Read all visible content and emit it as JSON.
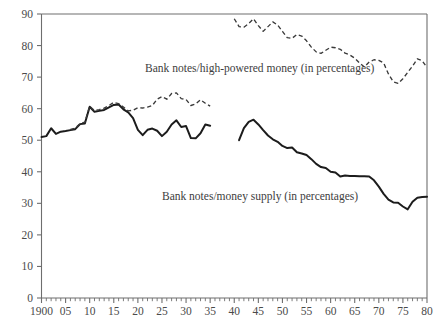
{
  "chart_data": {
    "type": "line",
    "title": "",
    "subtitle": "",
    "xlabel": "",
    "ylabel": "",
    "xlim": [
      1900,
      1980
    ],
    "ylim": [
      0,
      90
    ],
    "grid": false,
    "legend_position": "inline-annotations",
    "y_ticks": [
      0,
      10,
      20,
      30,
      40,
      50,
      60,
      70,
      80,
      90
    ],
    "y_tick_labels": [
      "0",
      "10",
      "20",
      "30",
      "40",
      "50",
      "60",
      "70",
      "80",
      "90"
    ],
    "x_ticks": [
      1900,
      1905,
      1910,
      1915,
      1920,
      1925,
      1930,
      1935,
      1940,
      1945,
      1950,
      1955,
      1960,
      1965,
      1970,
      1975,
      1980
    ],
    "x_tick_labels": [
      "1900",
      "05",
      "10",
      "15",
      "20",
      "25",
      "30",
      "35",
      "40",
      "45",
      "50",
      "55",
      "60",
      "65",
      "70",
      "75",
      "80"
    ],
    "x_minor_tick_step": 1,
    "annotations": [
      {
        "name": "annotation-high-powered-money",
        "text": "Bank notes/high-powered money (in percentages)",
        "x": 1921.5,
        "y": 71.5
      },
      {
        "name": "annotation-money-supply",
        "text": "Bank notes/money supply (in percentages)",
        "x": 1925.0,
        "y": 31.0
      }
    ],
    "series": [
      {
        "name": "Bank notes/money supply (in percentages)",
        "style": "solid",
        "color": "#1c1c1c",
        "segments": [
          {
            "x": [
              1900,
              1901,
              1902,
              1903,
              1904,
              1905,
              1906,
              1907,
              1908,
              1909,
              1910,
              1911,
              1912,
              1913,
              1914,
              1915,
              1916,
              1917,
              1918,
              1919,
              1920,
              1921,
              1922,
              1923,
              1924,
              1925,
              1926,
              1927,
              1928,
              1929,
              1930,
              1931,
              1932,
              1933,
              1934,
              1935
            ],
            "y": [
              51.0,
              51.3,
              53.8,
              52.0,
              52.7,
              52.9,
              53.2,
              53.5,
              55.1,
              55.3,
              60.6,
              59.0,
              59.3,
              59.6,
              60.4,
              61.2,
              61.3,
              59.8,
              58.8,
              57.0,
              53.3,
              51.6,
              53.3,
              53.7,
              53.0,
              51.3,
              52.7,
              55.0,
              56.3,
              54.2,
              54.5,
              50.7,
              50.6,
              52.2,
              55.0,
              54.6,
              53.5
            ]
          },
          {
            "x": [
              1941,
              1942,
              1943,
              1944,
              1945,
              1946,
              1947,
              1948,
              1949,
              1950,
              1951,
              1952,
              1953,
              1954,
              1955,
              1956,
              1957,
              1958,
              1959,
              1960,
              1961,
              1962,
              1963,
              1964,
              1965,
              1966,
              1967,
              1968,
              1969,
              1970,
              1971,
              1972,
              1973,
              1974,
              1975,
              1976,
              1977,
              1978,
              1979,
              1980
            ],
            "y": [
              50.0,
              53.8,
              55.8,
              56.5,
              55.0,
              53.2,
              51.5,
              50.3,
              49.5,
              48.2,
              47.5,
              47.7,
              46.2,
              45.8,
              45.3,
              44.0,
              42.5,
              41.5,
              41.2,
              40.0,
              39.8,
              38.5,
              38.8,
              38.7,
              38.7,
              38.6,
              38.6,
              38.5,
              37.3,
              35.3,
              33.0,
              31.2,
              30.3,
              30.2,
              29.0,
              28.1,
              30.5,
              31.8,
              32.0,
              32.1
            ]
          }
        ]
      },
      {
        "name": "Bank notes/high-powered money (in percentages)",
        "style": "dashed",
        "color": "#3a3a3a",
        "segments": [
          {
            "x": [
              1906,
              1907,
              1908,
              1909,
              1910,
              1911,
              1912,
              1913,
              1914,
              1915,
              1916,
              1917,
              1918,
              1919,
              1920,
              1921,
              1922,
              1923,
              1924,
              1925,
              1926,
              1927,
              1928,
              1929,
              1930,
              1931,
              1932,
              1933,
              1934,
              1935
            ],
            "y": [
              53.4,
              53.8,
              55.3,
              55.7,
              60.8,
              59.4,
              59.7,
              60.2,
              61.0,
              62.0,
              61.6,
              60.5,
              59.3,
              59.5,
              60.3,
              60.2,
              60.5,
              61.0,
              63.0,
              63.8,
              63.0,
              64.8,
              65.0,
              63.2,
              62.9,
              61.0,
              61.5,
              62.8,
              61.7,
              60.8,
              61.0
            ]
          },
          {
            "x": [
              1940,
              1941,
              1942,
              1943,
              1944,
              1945,
              1946,
              1947,
              1948,
              1949,
              1950,
              1951,
              1952,
              1953,
              1954,
              1955,
              1956,
              1957,
              1958,
              1959,
              1960,
              1961,
              1962,
              1963,
              1964,
              1965,
              1966,
              1967,
              1968,
              1969,
              1970,
              1971,
              1972,
              1973,
              1974,
              1975,
              1976,
              1977,
              1978,
              1979,
              1980
            ],
            "y": [
              88.5,
              86.0,
              85.8,
              87.0,
              88.5,
              86.3,
              84.5,
              86.0,
              87.5,
              86.5,
              84.5,
              82.5,
              82.3,
              83.5,
              83.0,
              81.5,
              79.5,
              78.0,
              77.5,
              78.5,
              79.5,
              79.3,
              78.8,
              77.6,
              77.0,
              76.0,
              74.5,
              73.2,
              74.8,
              75.5,
              75.3,
              74.5,
              71.0,
              68.5,
              68.0,
              69.5,
              71.5,
              73.5,
              75.8,
              75.2,
              73.0
            ]
          }
        ]
      }
    ]
  }
}
